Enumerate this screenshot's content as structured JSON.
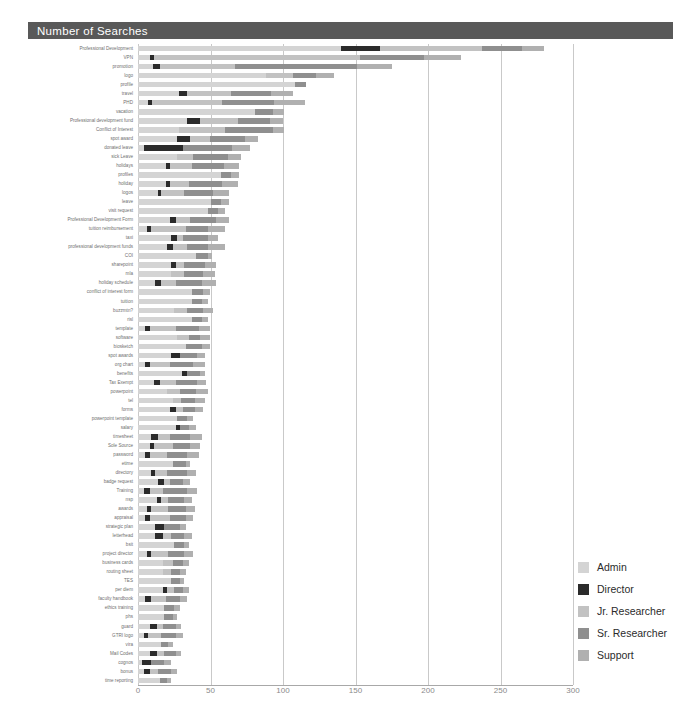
{
  "header": {
    "title": "Number of Searches"
  },
  "axis": {
    "ticks": [
      "0",
      "50",
      "100",
      "150",
      "200",
      "250",
      "300"
    ],
    "min": 0,
    "max": 300
  },
  "legend": {
    "items": [
      {
        "label": "Admin",
        "color": "#d4d4d4"
      },
      {
        "label": "Director",
        "color": "#2b2b2b"
      },
      {
        "label": "Jr. Researcher",
        "color": "#c2c2c2"
      },
      {
        "label": "Sr. Researcher",
        "color": "#8f8f8f"
      },
      {
        "label": "Support",
        "color": "#b0b0b0"
      }
    ]
  },
  "colors": {
    "title_bar": "#595959",
    "gridline": "#c9c9c9",
    "baseline": "#a8a8a8",
    "label_text": "#6f6f6f",
    "tick_text": "#8a8a8a"
  },
  "chart_data": {
    "type": "bar",
    "orientation": "horizontal",
    "stacked": true,
    "title": "Number of Searches",
    "xlabel": "",
    "ylabel": "",
    "xlim": [
      0,
      300
    ],
    "grid": true,
    "legend_position": "right",
    "series_names": [
      "Admin",
      "Director",
      "Jr. Researcher",
      "Sr. Researcher",
      "Support"
    ],
    "series_colors": [
      "#d4d4d4",
      "#2b2b2b",
      "#c2c2c2",
      "#8f8f8f",
      "#b0b0b0"
    ],
    "categories": [
      "Professional Development",
      "VPN",
      "promotion",
      "logo",
      "profile",
      "travel",
      "PHD",
      "vacation",
      "Professional development fund",
      "Conflict of Interest",
      "spot award",
      "donated leave",
      "sick Leave",
      "holidays",
      "profiles",
      "holiday",
      "logos",
      "leave",
      "visit request",
      "Professional Development Form",
      "tuition reimbursement",
      "taxi",
      "professional development funds",
      "COI",
      "sharepoint",
      "mla",
      "holiday schedule",
      "conflict of interest form",
      "tuition",
      "buzzmtn?",
      "risl",
      "template",
      "software",
      "biosketch",
      "spot awards",
      "org chart",
      "benefits",
      "Tax Exempt",
      "powerpoint",
      "tel",
      "forms",
      "powerpoint template",
      "salary",
      "timesheet",
      "Sole Source",
      "password",
      "etime",
      "directory",
      "badge request",
      "Training",
      "nsp",
      "awards",
      "appraisal",
      "strategic plan",
      "letterhead",
      "bsit",
      "project director",
      "business cards",
      "routing sheet",
      "TES",
      "per diem",
      "faculty handbook",
      "ethics training",
      "phs",
      "guard",
      "GTRI logo",
      "vira",
      "Mail Codes",
      "cognos",
      "bonus",
      "time reporting"
    ],
    "series": [
      {
        "name": "Admin",
        "values": [
          140,
          8,
          10,
          88,
          108,
          28,
          7,
          81,
          34,
          28,
          27,
          4,
          27,
          19,
          57,
          19,
          14,
          50,
          48,
          22,
          6,
          23,
          20,
          40,
          23,
          23,
          12,
          37,
          37,
          25,
          37,
          5,
          27,
          33,
          23,
          5,
          30,
          11,
          20,
          24,
          22,
          27,
          26,
          9,
          8,
          5,
          24,
          9,
          14,
          4,
          13,
          6,
          5,
          12,
          12,
          25,
          6,
          17,
          17,
          23,
          17,
          5,
          18,
          18,
          8,
          4,
          16,
          8,
          3,
          4,
          15
        ]
      },
      {
        "name": "Director",
        "values": [
          27,
          3,
          5,
          0,
          0,
          6,
          3,
          0,
          9,
          0,
          9,
          27,
          0,
          3,
          0,
          3,
          2,
          0,
          0,
          4,
          3,
          4,
          4,
          0,
          3,
          0,
          4,
          0,
          0,
          0,
          0,
          3,
          0,
          0,
          6,
          3,
          4,
          4,
          0,
          0,
          4,
          0,
          3,
          5,
          3,
          3,
          0,
          3,
          4,
          4,
          3,
          3,
          3,
          6,
          5,
          0,
          3,
          0,
          0,
          0,
          3,
          4,
          0,
          0,
          5,
          3,
          0,
          5,
          6,
          4,
          0
        ]
      },
      {
        "name": "Jr. Researcher",
        "values": [
          70,
          142,
          52,
          19,
          0,
          30,
          48,
          0,
          26,
          32,
          14,
          0,
          11,
          15,
          0,
          13,
          16,
          0,
          0,
          10,
          24,
          4,
          10,
          0,
          6,
          9,
          10,
          0,
          0,
          9,
          0,
          18,
          8,
          0,
          0,
          14,
          0,
          11,
          9,
          6,
          5,
          0,
          0,
          8,
          13,
          12,
          0,
          8,
          4,
          9,
          5,
          12,
          14,
          0,
          6,
          0,
          12,
          7,
          6,
          0,
          5,
          10,
          0,
          0,
          4,
          9,
          0,
          5,
          0,
          6,
          0
        ]
      },
      {
        "name": "Sr. Researcher",
        "values": [
          28,
          44,
          84,
          16,
          8,
          28,
          36,
          12,
          22,
          33,
          24,
          34,
          24,
          22,
          7,
          23,
          20,
          7,
          7,
          18,
          15,
          17,
          14,
          8,
          14,
          13,
          18,
          8,
          7,
          11,
          7,
          16,
          8,
          11,
          12,
          16,
          9,
          15,
          11,
          9,
          8,
          7,
          6,
          14,
          12,
          14,
          9,
          14,
          9,
          17,
          11,
          12,
          11,
          11,
          9,
          7,
          11,
          7,
          6,
          6,
          6,
          10,
          7,
          6,
          9,
          10,
          5,
          8,
          9,
          9,
          5
        ]
      },
      {
        "name": "Support",
        "values": [
          15,
          26,
          24,
          12,
          0,
          15,
          21,
          8,
          9,
          8,
          9,
          12,
          9,
          11,
          6,
          11,
          11,
          6,
          5,
          9,
          12,
          7,
          12,
          3,
          8,
          8,
          10,
          5,
          4,
          7,
          4,
          8,
          7,
          6,
          5,
          8,
          3,
          6,
          8,
          7,
          6,
          4,
          5,
          8,
          7,
          8,
          3,
          6,
          5,
          7,
          5,
          6,
          5,
          4,
          5,
          3,
          6,
          4,
          4,
          3,
          4,
          5,
          4,
          3,
          4,
          5,
          3,
          4,
          5,
          4,
          3
        ]
      }
    ]
  }
}
